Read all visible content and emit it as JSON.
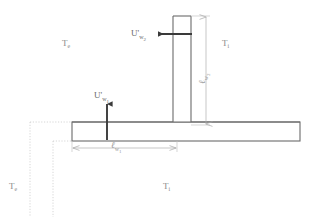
{
  "figure": {
    "type": "technical-diagram",
    "background_color": "#ffffff"
  },
  "colors": {
    "outline": "#6b6b6b",
    "arrow": "#3a3a3a",
    "dimension_line": "#b0b0b0",
    "construction_line": "#cccccc",
    "label_text": "#8a8a8a",
    "arrow_label_text": "#6a6a6a"
  },
  "temperature_labels": [
    {
      "id": "te-top-left",
      "base": "T",
      "subscript": "e",
      "x": 62,
      "y": 39
    },
    {
      "id": "ti-top-right",
      "base": "T",
      "subscript": "i",
      "x": 222,
      "y": 39
    },
    {
      "id": "te-bottom-left",
      "base": "T",
      "subscript": "e",
      "x": 9,
      "y": 182
    },
    {
      "id": "ti-bottom-center",
      "base": "T",
      "subscript": "i",
      "x": 163,
      "y": 182
    }
  ],
  "flux_labels": [
    {
      "id": "u-w2",
      "base": "U",
      "prime": "'",
      "subscript": "w",
      "sub_subscript": "2",
      "x": 131,
      "y": 29,
      "arrow_direction": "left"
    },
    {
      "id": "u-w1",
      "base": "U",
      "prime": "'",
      "subscript": "w",
      "sub_subscript": "1",
      "x": 94,
      "y": 91,
      "arrow_direction": "up"
    }
  ],
  "dimension_labels": [
    {
      "id": "l-w1",
      "base": "ℓ",
      "subscript": "w",
      "sub_subscript": "1",
      "orientation": "horizontal",
      "x": 111,
      "y": 146
    },
    {
      "id": "l-w2",
      "base": "ℓ",
      "subscript": "w",
      "sub_subscript": "2",
      "orientation": "vertical",
      "x": 200,
      "y": 78
    }
  ],
  "geometry": {
    "slab": {
      "x": 72,
      "y": 122,
      "width": 228,
      "height": 19
    },
    "vertical_wall": {
      "x": 173,
      "y": 16,
      "width": 18,
      "height": 106
    },
    "slab_dimension": {
      "from_x": 72,
      "to_x": 177,
      "y": 148
    },
    "wall_dimension": {
      "x": 206,
      "from_y": 16,
      "to_y": 125
    }
  }
}
